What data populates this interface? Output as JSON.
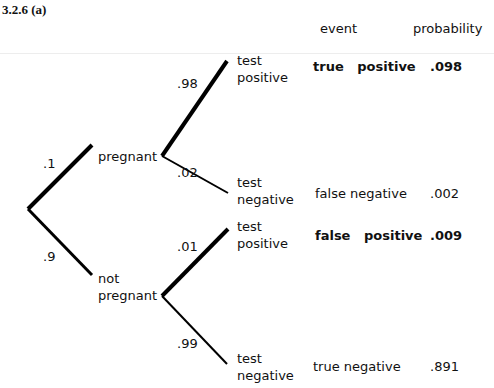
{
  "title": "3.2.6 (a)",
  "columns": {
    "event": "event",
    "probability": "probability"
  },
  "nodes": {
    "pregnant": "pregnant",
    "not_pregnant_line1": "not",
    "not_pregnant_line2": "pregnant"
  },
  "branch_probs": {
    "pregnant": ".1",
    "not_pregnant": ".9",
    "preg_pos": ".98",
    "preg_neg": ".02",
    "notpreg_pos": ".01",
    "notpreg_neg": ".99"
  },
  "outcomes": [
    {
      "line1": "test",
      "line2": "positive",
      "event": "true   positive",
      "probability": ".098",
      "bold": true
    },
    {
      "line1": "test",
      "line2": "negative",
      "event": "false negative",
      "probability": ".002",
      "bold": false
    },
    {
      "line1": "test",
      "line2": "positive",
      "event": "false   positive",
      "probability": ".009",
      "bold": true
    },
    {
      "line1": "test",
      "line2": "negative",
      "event": "true negative",
      "probability": ".891",
      "bold": false
    }
  ]
}
